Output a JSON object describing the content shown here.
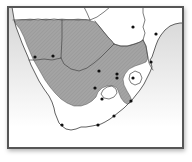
{
  "figure": {
    "region": "Southern Africa"
  },
  "colors": {
    "frame": "#565656",
    "ocean_top": "#d4d4d4",
    "ocean_mid": "#eaeaea",
    "ocean_bottom": "#ffffff",
    "land": "#ffffff",
    "outline": "#454545",
    "range_fill": "#a4a4a4",
    "range_hatch": "#939393",
    "dot": "#101010"
  },
  "map": {
    "shaded_range_present": true,
    "dot_radius": 1.6,
    "localities": [
      {
        "x": 35,
        "y": 57
      },
      {
        "x": 53,
        "y": 56
      },
      {
        "x": 99,
        "y": 71
      },
      {
        "x": 133,
        "y": 27
      },
      {
        "x": 156,
        "y": 34
      },
      {
        "x": 117,
        "y": 74
      },
      {
        "x": 117,
        "y": 78
      },
      {
        "x": 133,
        "y": 78
      },
      {
        "x": 95,
        "y": 88
      },
      {
        "x": 102,
        "y": 99
      },
      {
        "x": 151,
        "y": 62
      },
      {
        "x": 131,
        "y": 101
      },
      {
        "x": 114,
        "y": 116
      },
      {
        "x": 98,
        "y": 125
      },
      {
        "x": 62,
        "y": 125
      }
    ]
  }
}
